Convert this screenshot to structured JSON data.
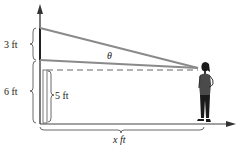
{
  "diagram": {
    "labels": {
      "top_segment": "3 ft",
      "wall_height": "6 ft",
      "eye_height": "5 ft",
      "distance": "x ft",
      "angle": "θ"
    },
    "colors": {
      "line": "#8a8a8a",
      "axis": "#333333",
      "text": "#222222",
      "figure": "#1a1a1a",
      "shirt": "#4a4a4a"
    },
    "figure": "woman-viewer"
  }
}
